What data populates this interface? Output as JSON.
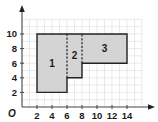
{
  "figure": {
    "type": "coordinate-grid-composite-figure",
    "origin_label": "O",
    "x_axis": {
      "ticks": [
        2,
        4,
        6,
        8,
        10,
        12,
        14
      ],
      "tick_labels": [
        "2",
        "4",
        "6",
        "8",
        "10",
        "12",
        "14"
      ],
      "grid_max": 16
    },
    "y_axis": {
      "ticks": [
        2,
        4,
        6,
        8,
        10
      ],
      "tick_labels": [
        "2",
        "4",
        "6",
        "8",
        "10"
      ],
      "grid_max": 12
    },
    "outline_vertices": [
      [
        2,
        2
      ],
      [
        6,
        2
      ],
      [
        6,
        4
      ],
      [
        8,
        4
      ],
      [
        8,
        6
      ],
      [
        14,
        6
      ],
      [
        14,
        10
      ],
      [
        2,
        10
      ]
    ],
    "dashed_dividers": [
      {
        "from": [
          6,
          4
        ],
        "to": [
          6,
          10
        ]
      },
      {
        "from": [
          8,
          6
        ],
        "to": [
          8,
          10
        ]
      }
    ],
    "regions": [
      {
        "label": "1",
        "position": [
          4,
          6
        ]
      },
      {
        "label": "2",
        "position": [
          7,
          7
        ]
      },
      {
        "label": "3",
        "position": [
          11,
          8
        ]
      }
    ],
    "colors": {
      "fill": "#d4d4d4",
      "outline": "#222222",
      "grid": "#dcdcdc",
      "axis": "#444444"
    }
  }
}
